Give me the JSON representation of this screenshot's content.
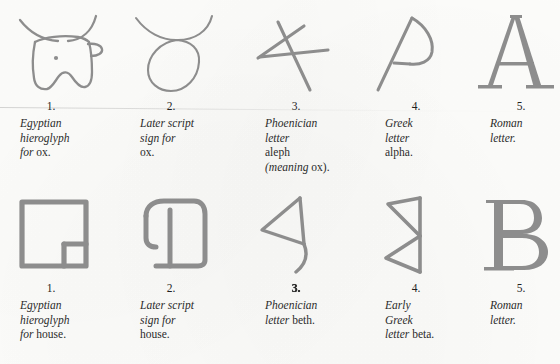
{
  "figure": {
    "title_visible": false,
    "ink_color": "#8d8d8d",
    "paper_color": "#fdfdfb"
  },
  "rows": [
    {
      "name": "ox-to-A",
      "cells": [
        {
          "number": "1.",
          "icon": "egyptian-ox-head-hieroglyph",
          "lines": [
            {
              "italic": "Egyptian",
              "roman": ""
            },
            {
              "italic": "hieroglyph",
              "roman": ""
            },
            {
              "italic": "for",
              "roman": " ox."
            }
          ]
        },
        {
          "number": "2.",
          "icon": "later-script-ox-sign",
          "lines": [
            {
              "italic": "Later script",
              "roman": ""
            },
            {
              "italic": "sign for",
              "roman": ""
            },
            {
              "italic": "",
              "roman": "ox."
            }
          ]
        },
        {
          "number": "3.",
          "icon": "phoenician-letter-aleph",
          "lines": [
            {
              "italic": "Phoenician",
              "roman": ""
            },
            {
              "italic": "letter",
              "roman": ""
            },
            {
              "italic": "",
              "roman": "aleph"
            },
            {
              "italic": "(meaning",
              "roman": " ox)."
            }
          ]
        },
        {
          "number": "4.",
          "icon": "greek-letter-alpha",
          "lines": [
            {
              "italic": "Greek",
              "roman": ""
            },
            {
              "italic": "letter",
              "roman": ""
            },
            {
              "italic": "",
              "roman": "alpha."
            }
          ]
        },
        {
          "number": "5.",
          "icon": "roman-letter-a",
          "lines": [
            {
              "italic": "Roman",
              "roman": ""
            },
            {
              "italic": "letter.",
              "roman": ""
            }
          ]
        }
      ]
    },
    {
      "name": "house-to-B",
      "cells": [
        {
          "number": "1.",
          "number_smudged": false,
          "icon": "egyptian-house-hieroglyph",
          "lines": [
            {
              "italic": "Egyptian",
              "roman": ""
            },
            {
              "italic": "hieroglyph",
              "roman": ""
            },
            {
              "italic": "for",
              "roman": " house."
            }
          ]
        },
        {
          "number": "2.",
          "number_smudged": false,
          "icon": "later-script-house-sign",
          "lines": [
            {
              "italic": "Later script",
              "roman": ""
            },
            {
              "italic": "sign for",
              "roman": ""
            },
            {
              "italic": "",
              "roman": "house."
            }
          ]
        },
        {
          "number": "3.",
          "number_smudged": true,
          "icon": "phoenician-letter-beth",
          "lines": [
            {
              "italic": "Phoenician",
              "roman": ""
            },
            {
              "italic": "letter",
              "roman": " beth."
            }
          ]
        },
        {
          "number": "4.",
          "number_smudged": false,
          "icon": "early-greek-letter-beta",
          "lines": [
            {
              "italic": "Early",
              "roman": ""
            },
            {
              "italic": "Greek",
              "roman": ""
            },
            {
              "italic": "letter",
              "roman": " beta."
            }
          ]
        },
        {
          "number": "5.",
          "number_smudged": false,
          "icon": "roman-letter-b",
          "lines": [
            {
              "italic": "Roman",
              "roman": ""
            },
            {
              "italic": "letter.",
              "roman": ""
            }
          ]
        }
      ]
    }
  ]
}
